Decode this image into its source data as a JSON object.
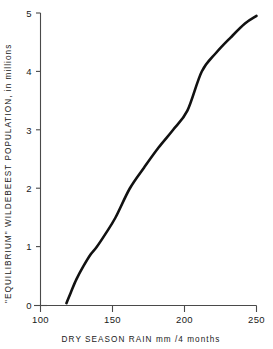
{
  "chart_data": {
    "type": "line",
    "title": "",
    "subtitle": "",
    "xlabel": "DRY SEASON RAIN   mm /4 months",
    "ylabel": "\"EQUILIBRIUM\"  WILDEBEEST  POPULATION,  in millions",
    "xlim": [
      100,
      250
    ],
    "ylim": [
      0,
      5
    ],
    "xticks": [
      100,
      150,
      200,
      250
    ],
    "yticks": [
      0,
      1,
      2,
      3,
      4,
      5
    ],
    "xtick_labels": [
      "100",
      "150",
      "200",
      "250"
    ],
    "ytick_labels": [
      "0",
      "1",
      "2",
      "3",
      "4",
      "5"
    ],
    "grid": false,
    "legend": null,
    "annotations": [],
    "series": [
      {
        "name": "equilibrium wildebeest population",
        "x": [
          118,
          121,
          125,
          130,
          135,
          139,
          145,
          152,
          162,
          172,
          182,
          192,
          202,
          212,
          222,
          232,
          242,
          250
        ],
        "y": [
          0.04,
          0.22,
          0.45,
          0.68,
          0.88,
          1.0,
          1.22,
          1.5,
          2.0,
          2.36,
          2.7,
          3.0,
          3.33,
          4.0,
          4.32,
          4.58,
          4.82,
          4.95
        ]
      }
    ]
  },
  "axis": {
    "x_title": "DRY SEASON RAIN   mm /4 months",
    "y_title": "\"EQUILIBRIUM\"  WILDEBEEST  POPULATION,  in millions",
    "x_labels": [
      "100",
      "150",
      "200",
      "250"
    ],
    "y_labels": [
      "5",
      "4",
      "3",
      "2",
      "1",
      "0"
    ]
  },
  "style": {
    "curve_color": "#111111",
    "axis_color": "#4a4a4a",
    "text_color": "#1a1a1a",
    "background": "#ffffff"
  }
}
